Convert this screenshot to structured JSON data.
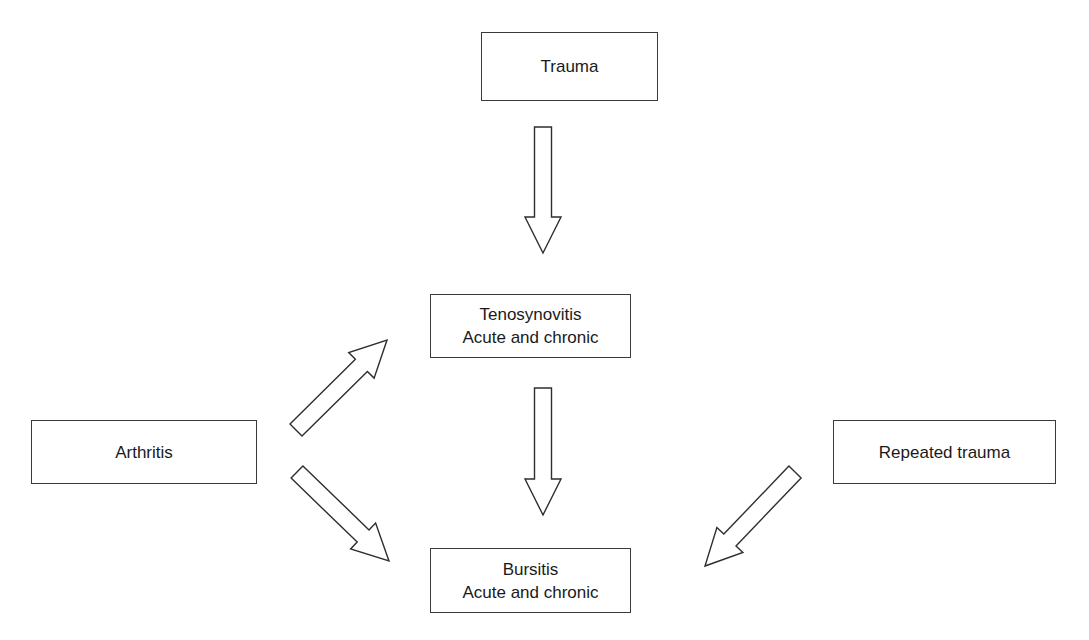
{
  "diagram": {
    "type": "flow",
    "nodes": [
      {
        "id": "trauma",
        "lines": [
          "Trauma"
        ]
      },
      {
        "id": "tenosynovitis",
        "lines": [
          "Tenosynovitis",
          "Acute and chronic"
        ]
      },
      {
        "id": "bursitis",
        "lines": [
          "Bursitis",
          "Acute and chronic"
        ]
      },
      {
        "id": "arthritis",
        "lines": [
          "Arthritis"
        ]
      },
      {
        "id": "repeated_trauma",
        "lines": [
          "Repeated trauma"
        ]
      }
    ],
    "edges": [
      {
        "from": "trauma",
        "to": "tenosynovitis"
      },
      {
        "from": "tenosynovitis",
        "to": "bursitis"
      },
      {
        "from": "arthritis",
        "to": "tenosynovitis"
      },
      {
        "from": "arthritis",
        "to": "bursitis"
      },
      {
        "from": "repeated_trauma",
        "to": "bursitis"
      }
    ],
    "arrow_style": "hollow block arrow"
  }
}
